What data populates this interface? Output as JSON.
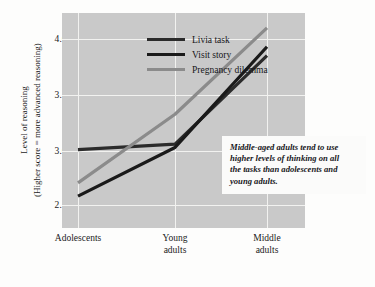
{
  "chart_data": {
    "type": "line",
    "title": "",
    "xlabel": "",
    "ylabel": "Level of reasoning (Higher score = more advanced reasoning)",
    "categories": [
      "Adolescents",
      "Young adults",
      "Middle adults"
    ],
    "ylim": [
      2.35,
      4.25
    ],
    "yticks": [
      "2.5",
      "3.0",
      "3.5",
      "4.0"
    ],
    "ytick_values": [
      2.5,
      3.0,
      3.5,
      4.0
    ],
    "grid": true,
    "legend_position": "top-left",
    "series": [
      {
        "name": "Livia task",
        "values": [
          3.0,
          3.05,
          3.85
        ],
        "color": "#2b2b2b"
      },
      {
        "name": "Visit story",
        "values": [
          2.58,
          3.02,
          3.93
        ],
        "color": "#1a1a1a"
      },
      {
        "name": "Pregnancy dilemma",
        "values": [
          2.7,
          3.32,
          4.1
        ],
        "color": "#8b8b8b"
      }
    ],
    "annotations": [
      "Middle-aged adults tend to use higher levels of thinking on all the tasks than adolescents and young adults."
    ]
  },
  "axis": {
    "y_title_line1": "Level of reasoning",
    "y_title_line2": "(Higher score = more advanced reasoning)",
    "x_labels": [
      {
        "line1": "Adolescents",
        "line2": ""
      },
      {
        "line1": "Young",
        "line2": "adults"
      },
      {
        "line1": "Middle",
        "line2": "adults"
      }
    ]
  },
  "legend": {
    "items": [
      {
        "label": "Livia task"
      },
      {
        "label": "Visit story"
      },
      {
        "label": "Pregnancy dilemma"
      }
    ]
  },
  "annotation": {
    "line1": "Middle-aged adults tend to use",
    "line2": "higher levels of thinking on all",
    "line3": "the tasks than adolescents and",
    "line4": "young adults."
  },
  "colors": {
    "panel": "#c9c9c9",
    "grid": "#f2f2f0",
    "page": "#fdfdfc",
    "series_dark_a": "#2b2b2b",
    "series_dark_b": "#1a1a1a",
    "series_gray": "#8b8b8b"
  }
}
